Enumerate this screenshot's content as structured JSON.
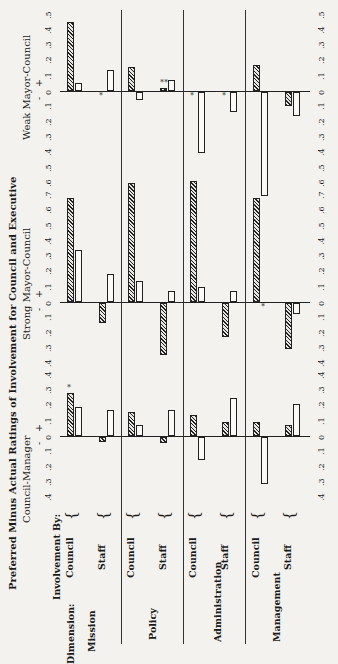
{
  "chart_data": {
    "type": "bar",
    "orientation": "rotated 90deg counter-clockwise (page printed sideways)",
    "title": "Preferred Minus Actual Ratings of Involvement for Council and Executive",
    "row_header": "Involvement By:",
    "column_header": "Dimension:",
    "dimensions": [
      "Mission",
      "Policy",
      "Administration",
      "Management"
    ],
    "involvement_by": [
      "Council",
      "Staff"
    ],
    "legend": {
      "hatched": "Council respondents",
      "open": "Executive respondents"
    },
    "sign_labels": {
      "minus": "-",
      "plus": "+"
    },
    "panels": [
      {
        "name": "Council-Manager",
        "axis_ticks": [
          ".4",
          ".3",
          ".2",
          ".1",
          "0",
          ".1",
          ".2",
          ".3",
          ".4"
        ],
        "ylim": [
          -0.4,
          0.4
        ],
        "categories": [
          "Mission-Council",
          "Mission-Staff",
          "Policy-Council",
          "Policy-Staff",
          "Administration-Council",
          "Administration-Staff",
          "Management-Council",
          "Management-Staff"
        ],
        "series": [
          {
            "name": "hatched",
            "values": [
              0.28,
              -0.03,
              0.16,
              -0.04,
              0.14,
              0.09,
              0.09,
              0.07
            ]
          },
          {
            "name": "open",
            "values": [
              0.19,
              0.17,
              0.07,
              0.17,
              -0.15,
              0.25,
              -0.31,
              0.21
            ]
          }
        ],
        "annotations": [
          {
            "category": "Mission-Council",
            "series": "hatched",
            "mark": "*"
          }
        ]
      },
      {
        "name": "Strong Mayor-Council",
        "axis_ticks": [
          ".4",
          ".3",
          ".2",
          ".1",
          "0",
          ".1",
          ".2",
          ".3",
          ".4",
          ".5",
          ".6",
          ".7"
        ],
        "ylim": [
          -0.4,
          0.7
        ],
        "categories": [
          "Mission-Council",
          "Mission-Staff",
          "Policy-Council",
          "Policy-Staff",
          "Administration-Council",
          "Administration-Staff",
          "Management-Council",
          "Management-Staff"
        ],
        "series": [
          {
            "name": "hatched",
            "values": [
              0.68,
              -0.13,
              0.78,
              -0.34,
              0.79,
              -0.22,
              0.68,
              -0.3
            ]
          },
          {
            "name": "open",
            "values": [
              0.34,
              0.18,
              0.14,
              0.07,
              0.1,
              0.07,
              0.0,
              -0.07
            ]
          }
        ],
        "annotations": [
          {
            "category": "Management-Council",
            "series": "open",
            "mark": "*"
          }
        ]
      },
      {
        "name": "Weak Mayor-Council",
        "axis_ticks": [
          ".6",
          ".5",
          ".4",
          ".3",
          ".2",
          ".1",
          "0",
          ".1",
          ".2",
          ".3",
          ".4",
          ".5"
        ],
        "ylim": [
          -0.6,
          0.5
        ],
        "categories": [
          "Mission-Council",
          "Mission-Staff",
          "Policy-Council",
          "Policy-Staff",
          "Administration-Council",
          "Administration-Staff",
          "Management-Council",
          "Management-Staff"
        ],
        "series": [
          {
            "name": "hatched",
            "values": [
              0.45,
              0.0,
              0.16,
              0.02,
              0.0,
              0.0,
              0.17,
              -0.09
            ]
          },
          {
            "name": "open",
            "values": [
              0.05,
              0.14,
              -0.05,
              0.07,
              -0.4,
              -0.13,
              -0.68,
              -0.16
            ]
          }
        ],
        "annotations": [
          {
            "category": "Mission-Staff",
            "series": "hatched",
            "mark": "*"
          },
          {
            "category": "Policy-Staff",
            "series": "hatched",
            "mark": "**"
          },
          {
            "category": "Administration-Council",
            "series": "hatched",
            "mark": "*"
          },
          {
            "category": "Administration-Staff",
            "series": "hatched",
            "mark": "*"
          }
        ]
      }
    ],
    "grid": false
  },
  "labels": {
    "title": "Preferred Minus Actual Ratings of Involvement for Council and Executive",
    "involvement_by": "Involvement By:",
    "dimension": "Dimension:",
    "council": "Council",
    "staff": "Staff",
    "mission": "Mission",
    "policy": "Policy",
    "administration": "Administration",
    "management": "Management",
    "panel_cm": "Council-Manager",
    "panel_smc": "Strong Mayor-Council",
    "panel_wmc": "Weak Mayor-Council",
    "minus": "-",
    "plus": "+",
    "star": "*"
  }
}
